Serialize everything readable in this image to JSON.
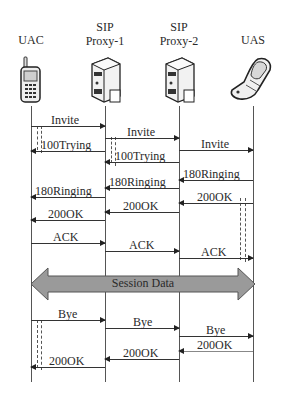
{
  "diagram": {
    "type": "sequence",
    "participants": [
      {
        "id": "uac",
        "label": "UAC",
        "icon": "mobile-phone-icon"
      },
      {
        "id": "proxy1",
        "label_line1": "SIP",
        "label_line2": "Proxy-1",
        "icon": "server-icon"
      },
      {
        "id": "proxy2",
        "label_line1": "SIP",
        "label_line2": "Proxy-2",
        "icon": "server-icon"
      },
      {
        "id": "uas",
        "label": "UAS",
        "icon": "flip-phone-icon"
      }
    ],
    "messages": [
      {
        "label": "Invite",
        "from": "uac",
        "to": "proxy1"
      },
      {
        "label": "100Trying",
        "from": "proxy1",
        "to": "uac"
      },
      {
        "label": "Invite",
        "from": "proxy1",
        "to": "proxy2"
      },
      {
        "label": "100Trying",
        "from": "proxy2",
        "to": "proxy1"
      },
      {
        "label": "Invite",
        "from": "proxy2",
        "to": "uas"
      },
      {
        "label": "180Ringing",
        "from": "uas",
        "to": "proxy2"
      },
      {
        "label": "180Ringing",
        "from": "proxy2",
        "to": "proxy1"
      },
      {
        "label": "180Ringing",
        "from": "proxy1",
        "to": "uac"
      },
      {
        "label": "200OK",
        "from": "uas",
        "to": "proxy2"
      },
      {
        "label": "200OK",
        "from": "proxy2",
        "to": "proxy1"
      },
      {
        "label": "200OK",
        "from": "proxy1",
        "to": "uac"
      },
      {
        "label": "ACK",
        "from": "uac",
        "to": "proxy1"
      },
      {
        "label": "ACK",
        "from": "proxy1",
        "to": "proxy2"
      },
      {
        "label": "ACK",
        "from": "proxy2",
        "to": "uas"
      },
      {
        "label": "Bye",
        "from": "uac",
        "to": "proxy1"
      },
      {
        "label": "Bye",
        "from": "proxy1",
        "to": "proxy2"
      },
      {
        "label": "Bye",
        "from": "proxy2",
        "to": "uas"
      },
      {
        "label": "200OK",
        "from": "uas",
        "to": "proxy2"
      },
      {
        "label": "200OK",
        "from": "proxy2",
        "to": "proxy1"
      },
      {
        "label": "200OK",
        "from": "proxy1",
        "to": "uac"
      }
    ],
    "session_bar": {
      "label": "Session Data",
      "from": "uac",
      "to": "uas"
    },
    "colors": {
      "line": "#333333",
      "session_fill": "#9a9a9a",
      "session_stroke": "#555555"
    }
  }
}
